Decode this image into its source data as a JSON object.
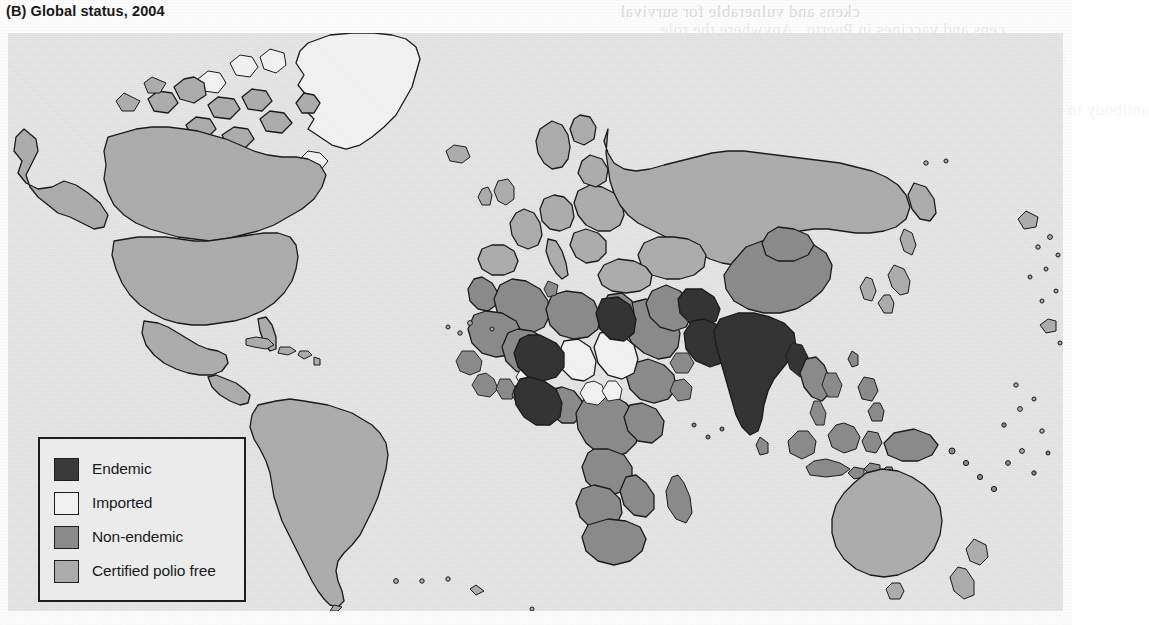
{
  "figure": {
    "panel_label": "(B)",
    "title": "(B) Global status, 2004",
    "year": "2004"
  },
  "legend": {
    "items": [
      {
        "label": "Endemic",
        "color": "#3a3a3a",
        "key": "endemic"
      },
      {
        "label": "Imported",
        "color": "#f2f2f2",
        "key": "imported"
      },
      {
        "label": "Non-endemic",
        "color": "#8b8b8b",
        "key": "non-endemic"
      },
      {
        "label": "Certified polio free",
        "color": "#adadad",
        "key": "certified-polio-free"
      }
    ]
  },
  "map": {
    "ocean_color": "#e6e6e6",
    "border_color": "#1a1a1a",
    "projection_note": "world map, Robinson-like",
    "status_colors": {
      "endemic": "#3a3a3a",
      "imported": "#f2f2f2",
      "non_endemic": "#8b8b8b",
      "certified_polio_free": "#adadad"
    },
    "regions": [
      {
        "name": "North America",
        "status": "certified_polio_free"
      },
      {
        "name": "Greenland",
        "status": "imported"
      },
      {
        "name": "South America",
        "status": "certified_polio_free"
      },
      {
        "name": "Western Europe",
        "status": "certified_polio_free"
      },
      {
        "name": "Russia and Central Asia",
        "status": "certified_polio_free"
      },
      {
        "name": "Australia and New Zealand",
        "status": "certified_polio_free"
      },
      {
        "name": "East and Southeast Asia",
        "status": "non_endemic"
      },
      {
        "name": "Sub-Saharan Africa",
        "status": "non_endemic"
      },
      {
        "name": "North Africa and Middle East",
        "status": "non_endemic"
      },
      {
        "name": "India",
        "status": "endemic"
      },
      {
        "name": "Pakistan",
        "status": "endemic"
      },
      {
        "name": "Afghanistan",
        "status": "endemic"
      },
      {
        "name": "Egypt",
        "status": "endemic"
      },
      {
        "name": "Niger",
        "status": "endemic"
      },
      {
        "name": "Nigeria",
        "status": "endemic"
      },
      {
        "name": "Chad",
        "status": "imported"
      },
      {
        "name": "Sudan",
        "status": "imported"
      }
    ]
  },
  "page_bleed": {
    "lines": [
      "ckens and vulnerable for survival",
      "cens and vaccines in Puerto . Anywhere the role",
      "sites who evaluated the outbreak and contained the",
      "tinuation of the risk. The of virus isolated from the",
      "antibody to the same type. Detection was consistent with",
      "of the 2000 outbreak of polio",
      "the first such outbreak reported",
      "more than a decade was caused by",
      "type 1 poliovirus that had circulated",
      "the population for some years before",
      "outbreak and was associated with",
      "low vaccine coverage in parts of",
      "Hispaniola."
    ],
    "heading": "10.5 Conclusions",
    "footer_lines": [
      "Expansion of the vaccine and the serological response of human",
      "to the standard vaccination schedule for immunization of the",
      "population persons with available data from vaccines and other",
      "clinically evaluated by Chen revealed in Tables 10.1 to 10.5."
    ]
  }
}
